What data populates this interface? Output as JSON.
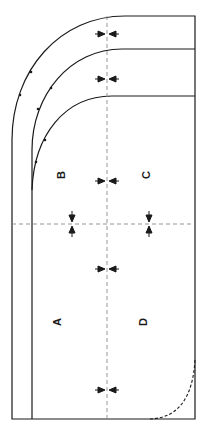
{
  "diagram": {
    "type": "pattern-layout",
    "panels": [
      {
        "id": "A",
        "label": "A"
      },
      {
        "id": "B",
        "label": "B"
      },
      {
        "id": "C",
        "label": "C"
      },
      {
        "id": "D",
        "label": "D"
      }
    ],
    "labels": {
      "a": "A",
      "b": "B",
      "c": "C",
      "d": "D"
    },
    "markers": {
      "horizontal_pinch_arrows": 5,
      "vertical_pinch_arrows": 2,
      "notch_dots": 6
    },
    "colors": {
      "line": "#1a1a1a",
      "guide_dash": "#8a8a8a",
      "background": "#ffffff"
    }
  }
}
